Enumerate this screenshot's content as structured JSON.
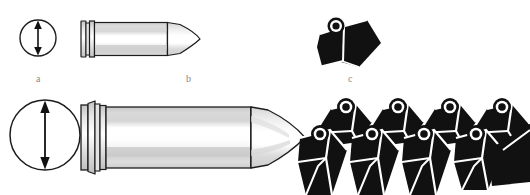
{
  "figure": {
    "background_color": "#ffffff",
    "width": 530,
    "height": 195,
    "labels": [
      {
        "id": "a",
        "text": "a",
        "x": 36,
        "y": 74,
        "refers_to": "small-calibre-diameter-circle"
      },
      {
        "id": "b",
        "text": "b",
        "x": 186,
        "y": 74,
        "refers_to": "small-cartridge-side-view"
      },
      {
        "id": "c",
        "text": "c",
        "x": 348,
        "y": 74,
        "refers_to": "single-faceted-element"
      }
    ],
    "colors": {
      "outline": "#1a1a1a",
      "solid_fill": "#111111",
      "metal_light": "#ffffff",
      "metal_mid": "#d9d9d9",
      "metal_shadow": "#b8b8b8",
      "label_text": "#8a8a8a",
      "highlight": "#f2f2f2"
    },
    "items": {
      "small_circle": {
        "name": "small calibre end view",
        "center_x": 38,
        "center_y": 38,
        "radius": 18,
        "arrow": "vertical-double-headed-diameter-arrow"
      },
      "large_circle": {
        "name": "large calibre end view",
        "center_x": 45,
        "center_y": 135,
        "radius": 35,
        "arrow": "vertical-double-headed-diameter-arrow"
      },
      "small_cartridge": {
        "name": "small cartridge side view",
        "x": 80,
        "y": 20,
        "width": 120,
        "height": 38,
        "features": [
          "rimmed-base",
          "extraction-groove",
          "cylindrical-case",
          "ogive-projectile-tip"
        ]
      },
      "large_cartridge": {
        "name": "large cartridge side view",
        "x": 80,
        "y": 100,
        "width": 225,
        "height": 72,
        "features": [
          "flanged-rim",
          "extraction-groove",
          "cylindrical-case",
          "ogive-projectile-tip"
        ]
      },
      "single_element": {
        "name": "single faceted shaped element",
        "x": 318,
        "y": 18,
        "width": 62,
        "height": 52,
        "features": [
          "ring-boss-top-left",
          "angled-top-facet",
          "left-facet",
          "large-right-facet"
        ]
      },
      "element_array": {
        "name": "tessellated array of faceted elements",
        "x": 300,
        "y": 100,
        "width": 230,
        "height": 95,
        "rows": 2,
        "back_row_count": 4,
        "front_row_count": 4,
        "total_visible": 8,
        "arrangement": "staggered-offset-rows"
      }
    }
  }
}
